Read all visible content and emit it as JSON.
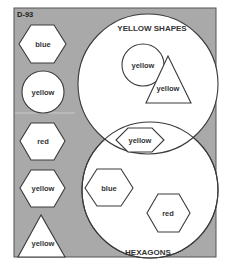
{
  "panel": {
    "code": "D-93",
    "background_color": "#a9a9a9",
    "border_color": "#555555"
  },
  "venn": {
    "top_circle": {
      "label": "YELLOW SHAPES"
    },
    "bottom_circle": {
      "label": "HEXAGONS"
    },
    "items": [
      {
        "shape": "circle",
        "label": "yellow",
        "region": "yellow-shapes-only"
      },
      {
        "shape": "triangle",
        "label": "yellow",
        "region": "yellow-shapes-only"
      },
      {
        "shape": "hexagon",
        "label": "yellow",
        "region": "overlap"
      },
      {
        "shape": "hexagon",
        "label": "blue",
        "region": "hexagons-only"
      },
      {
        "shape": "hexagon",
        "label": "red",
        "region": "hexagons-only"
      }
    ]
  },
  "unsorted": {
    "items": [
      {
        "shape": "hexagon",
        "label": "blue"
      },
      {
        "shape": "circle",
        "label": "yellow"
      },
      {
        "shape": "hexagon",
        "label": "red"
      },
      {
        "shape": "hexagon",
        "label": "yellow"
      },
      {
        "shape": "triangle",
        "label": "yellow"
      }
    ]
  }
}
